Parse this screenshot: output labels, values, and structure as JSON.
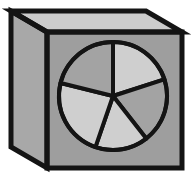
{
  "figure": {
    "title": "Shaded cube with five-slice pie circle on front face",
    "canvas": {
      "width": 193,
      "height": 181,
      "background": "#ffffff"
    },
    "outline_color": "#141414",
    "outline_width": 5,
    "cube": {
      "name": "isometric-cube",
      "front_face": {
        "label": "front face",
        "fill": "#9e9e9e",
        "points": "47,32 182,32 182,168 47,168"
      },
      "top_face": {
        "label": "top face",
        "fill": "#cccccc",
        "points": "47,32 11,11 146,11 182,32"
      },
      "left_face": {
        "label": "left face",
        "fill": "#a8a8a8",
        "points": "11,11 47,32 47,168 11,147"
      }
    },
    "pie": {
      "name": "five-slice-pie",
      "center_x": 113,
      "center_y": 96,
      "radius": 54,
      "slice_count": 5,
      "stroke": "#141414",
      "stroke_width": 4,
      "colors": {
        "light": "#cfcfcf",
        "medium": "#a3a3a3"
      },
      "slices": [
        {
          "label": "slice-1",
          "start_deg": 0,
          "end_deg": 72,
          "span_deg": 72,
          "fill": "#cfcfcf"
        },
        {
          "label": "slice-2",
          "start_deg": 72,
          "end_deg": 142,
          "span_deg": 70,
          "fill": "#a3a3a3"
        },
        {
          "label": "slice-3",
          "start_deg": 142,
          "end_deg": 199,
          "span_deg": 57,
          "fill": "#cfcfcf"
        },
        {
          "label": "slice-4",
          "start_deg": 199,
          "end_deg": 284,
          "span_deg": 85,
          "fill": "#cfcfcf"
        },
        {
          "label": "slice-5",
          "start_deg": 284,
          "end_deg": 360,
          "span_deg": 76,
          "fill": "#a3a3a3"
        }
      ]
    }
  }
}
